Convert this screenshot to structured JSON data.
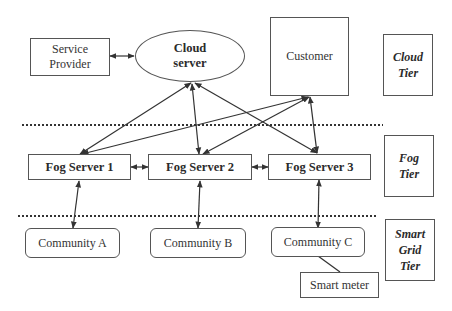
{
  "diagram": {
    "cloud_layer": {
      "service_provider": "Service Provider",
      "service_provider_lines": [
        "Service",
        "Provider"
      ],
      "cloud_server_lines": [
        "Cloud",
        "server"
      ],
      "customer": "Customer"
    },
    "fog_layer": {
      "fog_server_1": "Fog Server 1",
      "fog_server_2": "Fog Server 2",
      "fog_server_3": "Fog Server 3"
    },
    "smart_grid_layer": {
      "community_a": "Community A",
      "community_b": "Community B",
      "community_c": "Community C",
      "smart_meter": "Smart meter"
    },
    "tiers": {
      "cloud_tier": [
        "Cloud",
        "Tier"
      ],
      "fog_tier": [
        "Fog",
        "Tier"
      ],
      "smart_grid_tier": [
        "Smart",
        "Grid",
        "Tier"
      ]
    },
    "colors": {
      "line": "#333333",
      "box_border": "#555555",
      "background": "#ffffff"
    }
  }
}
